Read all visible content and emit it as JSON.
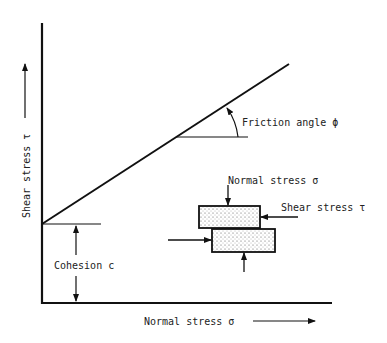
{
  "diagram": {
    "type": "Mohr-Coulomb failure envelope",
    "y_axis_label": "Shear stress τ",
    "x_axis_label": "Normal stress σ",
    "friction_label": "Friction angle ϕ",
    "cohesion_label": "Cohesion c",
    "block_normal_label": "Normal stress σ",
    "block_shear_label": "Shear stress τ",
    "colors": {
      "ink": "#111111",
      "background": "#ffffff",
      "stipple": "#dcdcdc"
    }
  }
}
